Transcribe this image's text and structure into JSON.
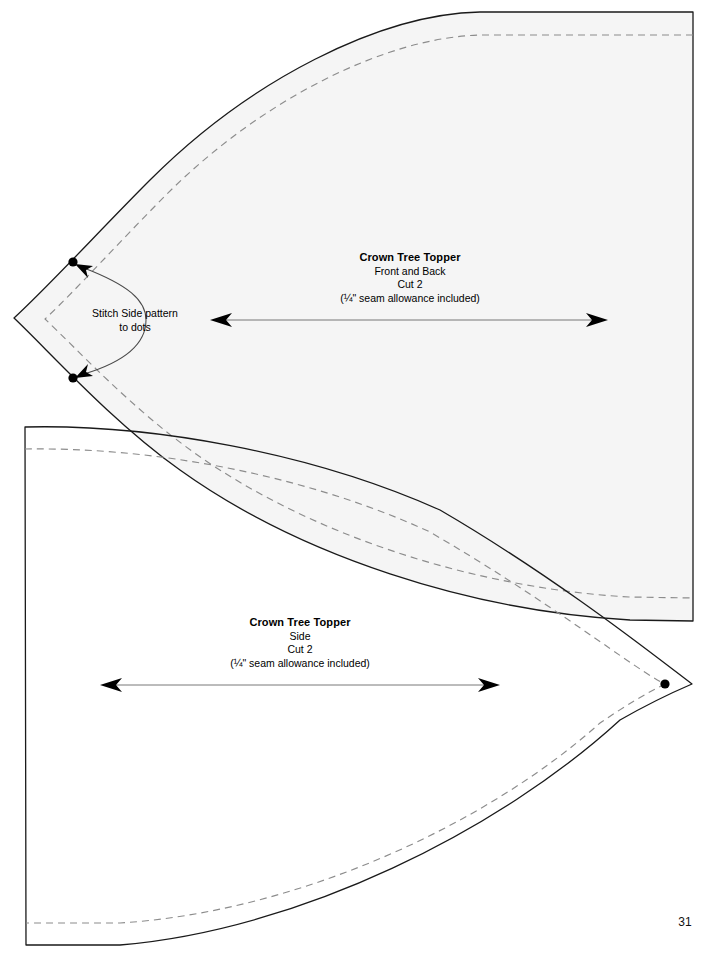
{
  "page": {
    "number": "31",
    "background_color": "#ffffff",
    "piece_fill_color": "#f5f5f5",
    "cut_line_color": "#1a1a1a",
    "seam_line_color": "#8c8c8c",
    "marker_color": "#000000"
  },
  "pieces": [
    {
      "id": "front-back",
      "title": "Crown Tree Topper",
      "subtitle": "Front and Back",
      "cut": "Cut 2",
      "note": "(¼\" seam allowance included)",
      "grainline": "grainline-arrow-front-back"
    },
    {
      "id": "side",
      "title": "Crown Tree Topper",
      "subtitle": "Side",
      "cut": "Cut 2",
      "note": "(¼\" seam allowance included)",
      "grainline": "grainline-arrow-side"
    }
  ],
  "annotations": {
    "stitch_note_line1": "Stitch Side pattern",
    "stitch_note_line2": "to dots"
  },
  "markers": {
    "dot_top_label": "dot-marker-top",
    "dot_bottom_label": "dot-marker-bottom",
    "dot_side_tip_label": "dot-marker-side-tip"
  }
}
